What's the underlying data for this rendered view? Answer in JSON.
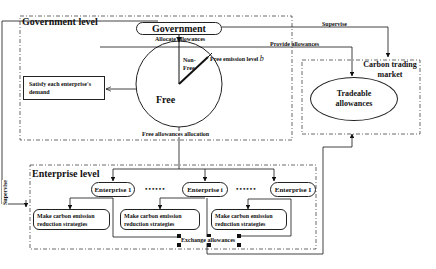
{
  "government_level": {
    "title": "Government level",
    "government_node": "Government",
    "allocate_label": "Allocate allowances",
    "pie": {
      "free_label": "Free",
      "non_free_label": "Non-\nFree",
      "free_emission_label": "Free emission level",
      "free_emission_symbol": "b"
    },
    "satisfy_box": "Satisfy each enterprise's demand",
    "free_allocation_label": "Free allowances allocation"
  },
  "edges": {
    "supervise_top": "Supervise",
    "provide_allowances": "Provide allowances",
    "supervise_left": "Supervise",
    "exchange_allowances": "Exchange allowances"
  },
  "carbon_market": {
    "title_line1": "Carbon trading",
    "title_line2": "market",
    "node_line1": "Tradeable",
    "node_line2": "allowances"
  },
  "enterprise_level": {
    "title": "Enterprise level",
    "enterprises": [
      {
        "label": "Enterprise 1"
      },
      {
        "label": "Enterprise i"
      },
      {
        "label": "Enterprise I"
      }
    ],
    "ellipsis": "••••••",
    "strategy_boxes": [
      {
        "line1": "Make carbon emission",
        "line2": "reduction strategies"
      },
      {
        "line1": "Make carbon emission",
        "line2": "reduction strategies"
      },
      {
        "line1": "Make carbon emission",
        "line2": "reduction strategies"
      }
    ]
  }
}
